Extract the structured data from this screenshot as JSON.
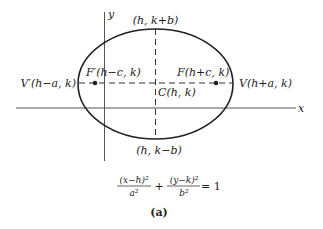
{
  "diagram": {
    "type": "ellipse-with-axes",
    "axes": {
      "x_label": "x",
      "y_label": "y"
    },
    "points": {
      "top": "(h, k+b)",
      "bottom": "(h, k−b)",
      "left_vertex": "V′(h−a, k)",
      "right_vertex": "V(h+a, k)",
      "left_focus": "F′(h−c, k)",
      "right_focus": "F(h+c, k)",
      "center": "C(h, k)"
    },
    "equation": {
      "term1_num": "(x−h)²",
      "term1_den": "a²",
      "plus": "+",
      "term2_num": "(y−k)²",
      "term2_den": "b²",
      "rhs": "= 1"
    },
    "caption": "(a)"
  },
  "colors": {
    "line": "#222222",
    "background": "#ffffff"
  }
}
